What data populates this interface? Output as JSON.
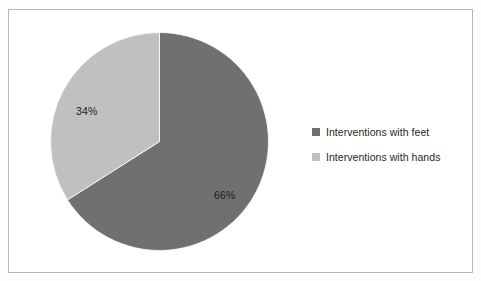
{
  "page": {
    "background_color": "#fdfdfd",
    "scan_remnant_text": "........................................................"
  },
  "chart_frame": {
    "border_color": "#b8b8b8",
    "background_color": "#ffffff"
  },
  "legend": {
    "position": "right",
    "items": [
      {
        "label": "Interventions with feet",
        "color": "#707070",
        "swatch_icon": "square-swatch-icon"
      },
      {
        "label": "Interventions with hands",
        "color": "#c0c0c0",
        "swatch_icon": "square-swatch-icon"
      }
    ]
  },
  "labels": {
    "slice_a": "66%",
    "slice_b": "34%"
  },
  "chart_data": {
    "type": "pie",
    "title": "",
    "subtitle": "",
    "xlabel": "",
    "ylabel": "",
    "grid": false,
    "legend_position": "right",
    "start_angle_deg": 0,
    "direction": "clockwise",
    "categories": [
      "Interventions with feet",
      "Interventions with hands"
    ],
    "values": [
      66,
      34
    ],
    "unit": "%",
    "data_labels": [
      "66%",
      "34%"
    ],
    "colors": [
      "#707070",
      "#c0c0c0"
    ],
    "slices": [
      {
        "name": "Interventions with feet",
        "value": 66,
        "label": "66%",
        "color": "#707070",
        "start_deg": 0,
        "end_deg": 237.6
      },
      {
        "name": "Interventions with hands",
        "value": 34,
        "label": "34%",
        "color": "#c0c0c0",
        "start_deg": 237.6,
        "end_deg": 360
      }
    ]
  }
}
